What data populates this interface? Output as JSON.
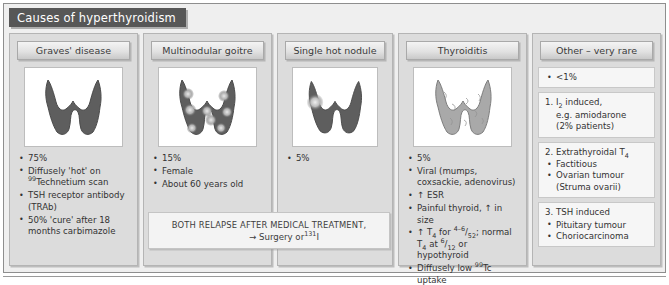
{
  "title": "Causes of hyperthyroidism",
  "columns": [
    {
      "id": "graves",
      "header": "Graves' disease",
      "scan": "diffuse-hot-thyroid-scan",
      "bullets": [
        {
          "parts": [
            {
              "t": "75%"
            }
          ]
        },
        {
          "parts": [
            {
              "t": "Diffusely 'hot' on "
            },
            {
              "t": "99",
              "sup": true
            },
            {
              "t": "Technetium scan"
            }
          ]
        },
        {
          "parts": [
            {
              "t": "TSH receptor antibody (TRAb)"
            }
          ]
        },
        {
          "parts": [
            {
              "t": "50% 'cure' after 18 months carbimazole"
            }
          ]
        }
      ]
    },
    {
      "id": "multinodular",
      "header": "Multinodular goitre",
      "scan": "multinodular-hot-spots-scan",
      "bullets": [
        {
          "parts": [
            {
              "t": "15%"
            }
          ]
        },
        {
          "parts": [
            {
              "t": "Female"
            }
          ]
        },
        {
          "parts": [
            {
              "t": "About 60 years old"
            }
          ]
        }
      ]
    },
    {
      "id": "single_nodule",
      "header": "Single hot nodule",
      "scan": "single-hot-nodule-scan",
      "bullets": [
        {
          "parts": [
            {
              "t": "5%"
            }
          ]
        }
      ]
    },
    {
      "id": "thyroiditis",
      "header": "Thyroiditis",
      "scan": "low-uptake-thyroid-scan",
      "bullets": [
        {
          "parts": [
            {
              "t": "5%"
            }
          ]
        },
        {
          "parts": [
            {
              "t": "Viral (mumps, coxsackie, adenovirus)"
            }
          ]
        },
        {
          "parts": [
            {
              "t": "↑ ESR"
            }
          ]
        },
        {
          "parts": [
            {
              "t": "Painful thyroid, ↑ in size"
            }
          ]
        },
        {
          "parts": [
            {
              "t": "↑ T"
            },
            {
              "t": "4",
              "sub": true
            },
            {
              "t": " for "
            },
            {
              "t": "4–6",
              "sup": true
            },
            {
              "t": "/"
            },
            {
              "t": "52",
              "sub": true
            },
            {
              "t": "; normal T"
            },
            {
              "t": "4",
              "sub": true
            },
            {
              "t": " at "
            },
            {
              "t": "6",
              "sup": true
            },
            {
              "t": "/"
            },
            {
              "t": "12",
              "sub": true
            },
            {
              "t": " or hypothyroid"
            }
          ]
        },
        {
          "parts": [
            {
              "t": "Diffusely low "
            },
            {
              "t": "99",
              "sup": true
            },
            {
              "t": "Tc uptake"
            }
          ]
        }
      ]
    }
  ],
  "other_panel": {
    "header": "Other – very rare",
    "sections": [
      {
        "kind": "bullet_only",
        "title": "",
        "bullets": [
          "<1%"
        ],
        "sub_lines": []
      },
      {
        "kind": "numbered",
        "title": "1. I₂ induced,",
        "sub_lines": [
          "e.g. amiodarone",
          "(2% patients)"
        ],
        "bullets": []
      },
      {
        "kind": "numbered",
        "title": "2. Extrathyroidal T₄",
        "sub_lines": [],
        "bullets": [
          "Factitious",
          "Ovarian tumour",
          "(Struma ovarii)"
        ]
      },
      {
        "kind": "numbered",
        "title": "3. TSH induced",
        "sub_lines": [],
        "bullets": [
          "Pituitary tumour",
          "Choriocarcinoma"
        ]
      }
    ]
  },
  "relapse_banner": {
    "line1": "BOTH RELAPSE AFTER MEDICAL TREATMENT,",
    "line2_arrow": "→ Surgery or",
    "line2_isotope": "131",
    "line2_element": "I"
  },
  "colors": {
    "title_bar": "#575757",
    "panel_bg": "#dcdcdc",
    "hot_gland": "#5e5e5e",
    "cold_gland": "#a9a9a9",
    "nodule_hot": "#d9d9d9"
  }
}
